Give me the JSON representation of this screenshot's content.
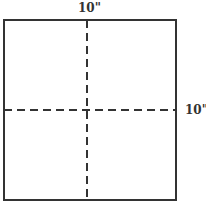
{
  "diagram": {
    "type": "square-with-fold-lines",
    "square": {
      "x": 4,
      "y": 20,
      "width": 172,
      "height": 180,
      "stroke": "#333333",
      "stroke_width": 2
    },
    "dashed_lines": [
      {
        "orientation": "vertical",
        "x1": 87,
        "y1": 20,
        "x2": 87,
        "y2": 200,
        "stroke": "#333333",
        "dash": "8,5"
      },
      {
        "orientation": "horizontal",
        "x1": 4,
        "y1": 110,
        "x2": 176,
        "y2": 110,
        "stroke": "#333333",
        "dash": "8,5"
      }
    ],
    "labels": {
      "top": "10\"",
      "right": "10\""
    },
    "colors": {
      "line": "#333333",
      "text": "#333333",
      "background": "#ffffff"
    }
  }
}
